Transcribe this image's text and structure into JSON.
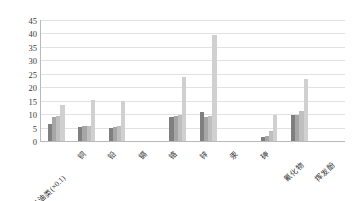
{
  "chart_data": {
    "type": "bar",
    "title": "",
    "subtitle": "",
    "xlabel": "",
    "ylabel": "",
    "ylim": [
      0,
      45
    ],
    "yticks": [
      0,
      5,
      10,
      15,
      20,
      25,
      30,
      35,
      40,
      45
    ],
    "ytick_labels": [
      "0",
      "5",
      "10",
      "15",
      "20",
      "25",
      "30",
      "35",
      "40",
      "45"
    ],
    "grid": true,
    "legend": "none",
    "categories": [
      "石油类(×0.1)",
      "铜",
      "铅",
      "镉",
      "铬",
      "锌",
      "汞",
      "砷",
      "氰化物",
      "挥发酚"
    ],
    "series": [
      {
        "name": "series-1",
        "color": "#7f7f7f",
        "values": [
          6.5,
          5.2,
          5.0,
          0.0,
          8.8,
          10.8,
          0.0,
          1.5,
          9.6,
          0.0
        ]
      },
      {
        "name": "series-2",
        "color": "#a6a6a6",
        "values": [
          8.8,
          5.4,
          5.2,
          0.0,
          9.3,
          8.9,
          0.0,
          2.0,
          9.8,
          0.0
        ]
      },
      {
        "name": "series-3",
        "color": "#bfbfbf",
        "values": [
          9.4,
          5.6,
          5.4,
          0.0,
          9.6,
          9.2,
          0.0,
          3.6,
          11.3,
          0.0
        ]
      },
      {
        "name": "series-4",
        "color": "#d0d0d0",
        "values": [
          13.4,
          15.2,
          15.0,
          0.0,
          23.8,
          39.5,
          0.0,
          9.6,
          23.0,
          0.0
        ]
      }
    ],
    "bar_fill_1": "#7f7f7f",
    "bar_fill_2": "#a6a6a6",
    "bar_fill_3": "#bfbfbf",
    "bar_fill_4": "#d0d0d0",
    "axis_color": "#b9b9b9",
    "grid_color": "#e2e2e2",
    "background": "#ffffff"
  }
}
